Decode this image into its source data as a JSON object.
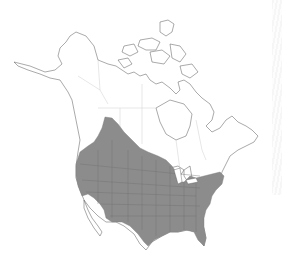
{
  "map": {
    "region": "North America (Canada, United States, northern Mexico)",
    "type": "species range map",
    "colors": {
      "background": "#ffffff",
      "range_fill": "#8c8c8c",
      "coastline": "#555555",
      "borders": "#cfcfcf",
      "range_borders": "#6e6e6e"
    },
    "layers": [
      {
        "name": "land-outline",
        "description": "coastlines of Alaska, Canada, Arctic islands, USA, Mexico"
      },
      {
        "name": "political-borders",
        "description": "state/province borders in light gray"
      },
      {
        "name": "species-range",
        "description": "shaded distribution covering most of contiguous US and south-central Canada"
      }
    ]
  }
}
